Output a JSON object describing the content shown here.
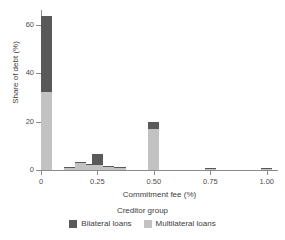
{
  "chart_data": {
    "type": "bar",
    "title": "",
    "subtitle": "",
    "xlabel": "Commitment fee (%)",
    "ylabel": "Share of debt (%)",
    "xlim": [
      0.0,
      1.05
    ],
    "ylim": [
      0,
      66
    ],
    "grid": false,
    "stacked": true,
    "bar_width": 0.05,
    "legend": {
      "title": "Creditor group",
      "position": "bottom",
      "entries": [
        {
          "name": "Bilateral loans",
          "color": "#595959"
        },
        {
          "name": "Multilateral loans",
          "color": "#c2c2c2"
        }
      ]
    },
    "xticks": [
      0,
      0.25,
      0.5,
      0.75,
      1.0
    ],
    "xtick_labels": [
      "0",
      "0.25",
      "0.50",
      "0.75",
      "1.00"
    ],
    "yticks": [
      0,
      20,
      40,
      60
    ],
    "ytick_labels": [
      "0",
      "20",
      "40",
      "60"
    ],
    "x": [
      0.025,
      0.125,
      0.175,
      0.225,
      0.25,
      0.3,
      0.35,
      0.5,
      0.75,
      1.0
    ],
    "series": [
      {
        "name": "Multilateral loans",
        "color": "#c2c2c2",
        "values": [
          32.0,
          1.1,
          3.0,
          2.0,
          2.0,
          1.1,
          1.0,
          17.0,
          0.5,
          0.5
        ]
      },
      {
        "name": "Bilateral loans",
        "color": "#595959",
        "values": [
          31.5,
          0.2,
          0.3,
          0.5,
          4.5,
          0.4,
          0.2,
          3.0,
          0.2,
          0.2
        ]
      }
    ],
    "totals": [
      63.5,
      1.3,
      3.3,
      2.5,
      6.5,
      1.5,
      1.2,
      20.0,
      0.7,
      0.7
    ]
  },
  "colors": {
    "bilateral": "#595959",
    "multilateral": "#c2c2c2",
    "axis": "#8c8c8c",
    "text": "#3d3d3d",
    "background": "#ffffff"
  }
}
